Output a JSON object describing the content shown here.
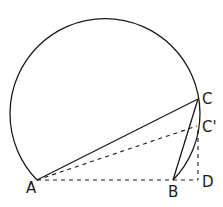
{
  "diagram": {
    "type": "geometry",
    "colors": {
      "stroke": "#1a1a1a",
      "background": "#ffffff"
    },
    "points": {
      "A": {
        "label": "A",
        "x": 37,
        "y": 180
      },
      "B": {
        "label": "B",
        "x": 173,
        "y": 180
      },
      "C": {
        "label": "C",
        "x": 198,
        "y": 99
      },
      "C_prime": {
        "label": "C'",
        "x": 197,
        "y": 126
      },
      "D": {
        "label": "D",
        "x": 198,
        "y": 180
      }
    },
    "circle": {
      "cx": 107,
      "cy": 112,
      "r": 95
    },
    "segments_solid": [
      "A-C",
      "C-B"
    ],
    "segments_dashed": [
      "A-C'",
      "A-D",
      "C'-D"
    ],
    "arcs": [
      "A-top-C-B (major arc)"
    ]
  }
}
